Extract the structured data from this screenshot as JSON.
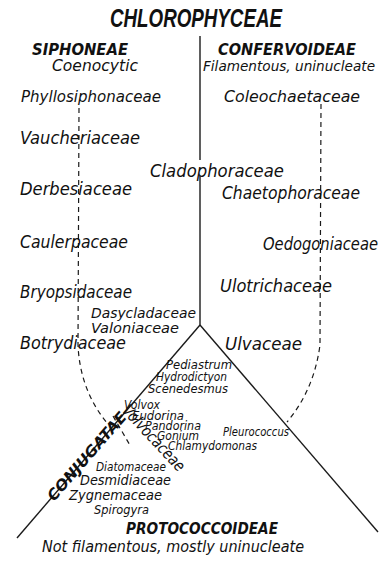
{
  "title": "CHLOROPHYCEAE",
  "groups": {
    "siphoneae": {
      "name": "SIPHONEAE",
      "description": "Coenocytic"
    },
    "confervoideae": {
      "name": "CONFERVOIDEAE",
      "description": "Filamentous, uninucleate"
    },
    "protococcoideae": {
      "name": "PROTOCOCCOIDEAE",
      "description": "Not filamentous, mostly uninucleate"
    },
    "conjugatae": {
      "name": "CONJUGATAE"
    },
    "volvocaceae": {
      "name": "Volvocaceae"
    }
  },
  "siphoneae_families": [
    "Phyllosiphonaceae",
    "Vaucheriaceae",
    "Derbesiaceae",
    "Caulerpaceae",
    "Bryopsidaceae",
    "Botrydiaceae"
  ],
  "center_families": [
    "Cladophoraceae",
    "Dasycladaceae",
    "Valoniaceae"
  ],
  "confervoideae_families": [
    "Coleochaetaceae",
    "Chaetophoraceae",
    "Oedogoniaceae",
    "Ulotrichaceae",
    "Ulvaceae"
  ],
  "protococcoideae_genera": [
    "Pediastrum",
    "Hydrodictyon",
    "Scenedesmus",
    "Pleurococcus"
  ],
  "volvocaceae_genera": [
    "Volvox",
    "Eudorina",
    "Pandorina",
    "Gonium",
    "Chlamydomonas"
  ],
  "conjugatae_families": [
    "Diatomaceae",
    "Desmidiaceae",
    "Zygnemaceae",
    "Spirogyra"
  ]
}
